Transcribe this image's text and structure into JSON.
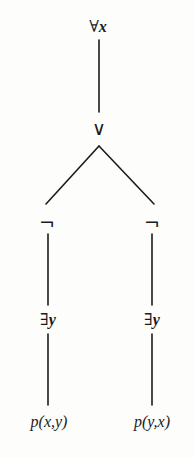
{
  "figure": {
    "type": "formula-parse-tree",
    "title": "",
    "background_color": "#fdfdfb",
    "ink_color": "#1b1b1b",
    "formula": "∀x (¬∃y p(x,y) ∨ ¬∃y p(y,x))"
  },
  "nodes": [
    {
      "id": "root",
      "label": "∀",
      "variable": "x",
      "kind": "universal-quantifier",
      "x": 98,
      "y": 27
    },
    {
      "id": "disjunction",
      "label": "∨",
      "kind": "disjunction",
      "x": 99,
      "y": 128
    },
    {
      "id": "neg-left",
      "label": "¬",
      "kind": "negation",
      "x": 47,
      "y": 223
    },
    {
      "id": "neg-right",
      "label": "¬",
      "kind": "negation",
      "x": 152,
      "y": 223
    },
    {
      "id": "exists-left",
      "label": "∃",
      "variable": "y",
      "kind": "existential-quantifier",
      "x": 48,
      "y": 320
    },
    {
      "id": "exists-right",
      "label": "∃",
      "variable": "y",
      "kind": "existential-quantifier",
      "x": 152,
      "y": 320
    },
    {
      "id": "atom-left",
      "label": "p(x,y)",
      "kind": "atomic-predicate",
      "x": 49,
      "y": 422
    },
    {
      "id": "atom-right",
      "label": "p(y,x)",
      "kind": "atomic-predicate",
      "x": 152,
      "y": 422
    }
  ],
  "edges": [
    {
      "id": "edge-root-disjunction",
      "from": "root",
      "to": "disjunction",
      "x1": 99,
      "y1": 40,
      "x2": 99,
      "y2": 112
    },
    {
      "id": "edge-disjunction-neg-left",
      "from": "disjunction",
      "to": "neg-left",
      "x1": 99,
      "y1": 146,
      "x2": 46,
      "y2": 204
    },
    {
      "id": "edge-disjunction-neg-right",
      "from": "disjunction",
      "to": "neg-right",
      "x1": 99,
      "y1": 146,
      "x2": 154,
      "y2": 204
    },
    {
      "id": "edge-neg-left-exists-left",
      "from": "neg-left",
      "to": "exists-left",
      "x1": 48,
      "y1": 234,
      "x2": 48,
      "y2": 305
    },
    {
      "id": "edge-neg-right-exists-right",
      "from": "neg-right",
      "to": "exists-right",
      "x1": 152,
      "y1": 234,
      "x2": 152,
      "y2": 305
    },
    {
      "id": "edge-exists-left-atom-left",
      "from": "exists-left",
      "to": "atom-left",
      "x1": 48,
      "y1": 334,
      "x2": 48,
      "y2": 405
    },
    {
      "id": "edge-exists-right-atom-right",
      "from": "exists-right",
      "to": "atom-right",
      "x1": 152,
      "y1": 334,
      "x2": 152,
      "y2": 405
    }
  ]
}
